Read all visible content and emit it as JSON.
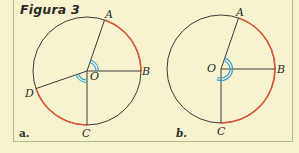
{
  "figure": {
    "title": "Figura 3",
    "colors": {
      "background": "#f8f3cf",
      "border": "#a9bf84",
      "circle": "#3a3a3a",
      "highlight_arc": "#e0593b",
      "angle_mark": "#3aa2d6",
      "text": "#2b2b2b"
    },
    "panels": [
      {
        "label": "a.",
        "center": {
          "x": 87,
          "y": 71
        },
        "radius": 54,
        "points": {
          "A": {
            "text": "A",
            "angle": -71,
            "label_x": 105,
            "label_y": 9
          },
          "B": {
            "text": "B",
            "angle": 0,
            "label_x": 142,
            "label_y": 66
          },
          "C": {
            "text": "C",
            "angle": 90,
            "label_x": 82,
            "label_y": 128
          },
          "D": {
            "text": "D",
            "angle": 161,
            "label_x": 25,
            "label_y": 88
          },
          "O": {
            "text": "O",
            "label_x": 90,
            "label_y": 71
          }
        },
        "red_arcs": [
          [
            -71,
            0
          ],
          [
            90,
            161
          ]
        ],
        "angle_marks": [
          [
            -71,
            0
          ],
          [
            90,
            161
          ]
        ],
        "panel_label_pos": {
          "x": 19,
          "y": 128
        }
      },
      {
        "label": "b.",
        "center": {
          "x": 221,
          "y": 69
        },
        "radius": 54,
        "points": {
          "A": {
            "text": "A",
            "angle": -71,
            "label_x": 236,
            "label_y": 7
          },
          "B": {
            "text": "B",
            "angle": 0,
            "label_x": 277,
            "label_y": 64
          },
          "C": {
            "text": "C",
            "angle": 90,
            "label_x": 217,
            "label_y": 126
          },
          "O": {
            "text": "O",
            "label_x": 207,
            "label_y": 63
          }
        },
        "red_arcs": [
          [
            -71,
            90
          ]
        ],
        "angle_marks": [
          [
            -71,
            112
          ]
        ],
        "panel_label_pos": {
          "x": 176,
          "y": 128
        }
      }
    ]
  }
}
